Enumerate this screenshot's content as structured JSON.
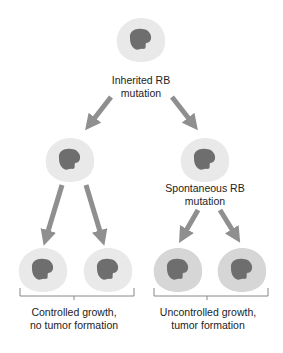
{
  "diagram": {
    "title": "",
    "colors": {
      "cytoplasm_normal": "#e9e9e9",
      "cytoplasm_tumor": "#d6d6d6",
      "nucleus": "#6e6e6e",
      "arrow": "#8f8f8f",
      "bracket": "#888888",
      "text": "#222222"
    },
    "nodes": [
      {
        "id": "top-cell",
        "kind": "cell",
        "state": "normal",
        "label_lines": [
          "Inherited RB",
          "mutation"
        ]
      },
      {
        "id": "mid-left-cell",
        "kind": "cell",
        "state": "normal",
        "label_lines": []
      },
      {
        "id": "mid-right-cell",
        "kind": "cell",
        "state": "normal",
        "label_lines": [
          "Spontaneous RB",
          "mutation"
        ]
      },
      {
        "id": "bottom-cell-1",
        "kind": "cell",
        "state": "normal"
      },
      {
        "id": "bottom-cell-2",
        "kind": "cell",
        "state": "normal"
      },
      {
        "id": "bottom-cell-3",
        "kind": "cell",
        "state": "tumor"
      },
      {
        "id": "bottom-cell-4",
        "kind": "cell",
        "state": "tumor"
      }
    ],
    "edges": [
      {
        "from": "top-cell",
        "to": "mid-left-cell"
      },
      {
        "from": "top-cell",
        "to": "mid-right-cell"
      },
      {
        "from": "mid-left-cell",
        "to": "bottom-cell-1"
      },
      {
        "from": "mid-left-cell",
        "to": "bottom-cell-2"
      },
      {
        "from": "mid-right-cell",
        "to": "bottom-cell-3"
      },
      {
        "from": "mid-right-cell",
        "to": "bottom-cell-4"
      }
    ],
    "labels": {
      "top": {
        "line1": "Inherited RB",
        "line2": "mutation"
      },
      "mid_right": {
        "line1": "Spontaneous RB",
        "line2": "mutation"
      },
      "group_left": {
        "line1": "Controlled growth,",
        "line2": "no tumor formation"
      },
      "group_right": {
        "line1": "Uncontrolled growth,",
        "line2": "tumor formation"
      }
    },
    "groups": [
      {
        "id": "group-left",
        "members": [
          "bottom-cell-1",
          "bottom-cell-2"
        ],
        "label": "Controlled growth, no tumor formation"
      },
      {
        "id": "group-right",
        "members": [
          "bottom-cell-3",
          "bottom-cell-4"
        ],
        "label": "Uncontrolled growth, tumor formation"
      }
    ]
  }
}
